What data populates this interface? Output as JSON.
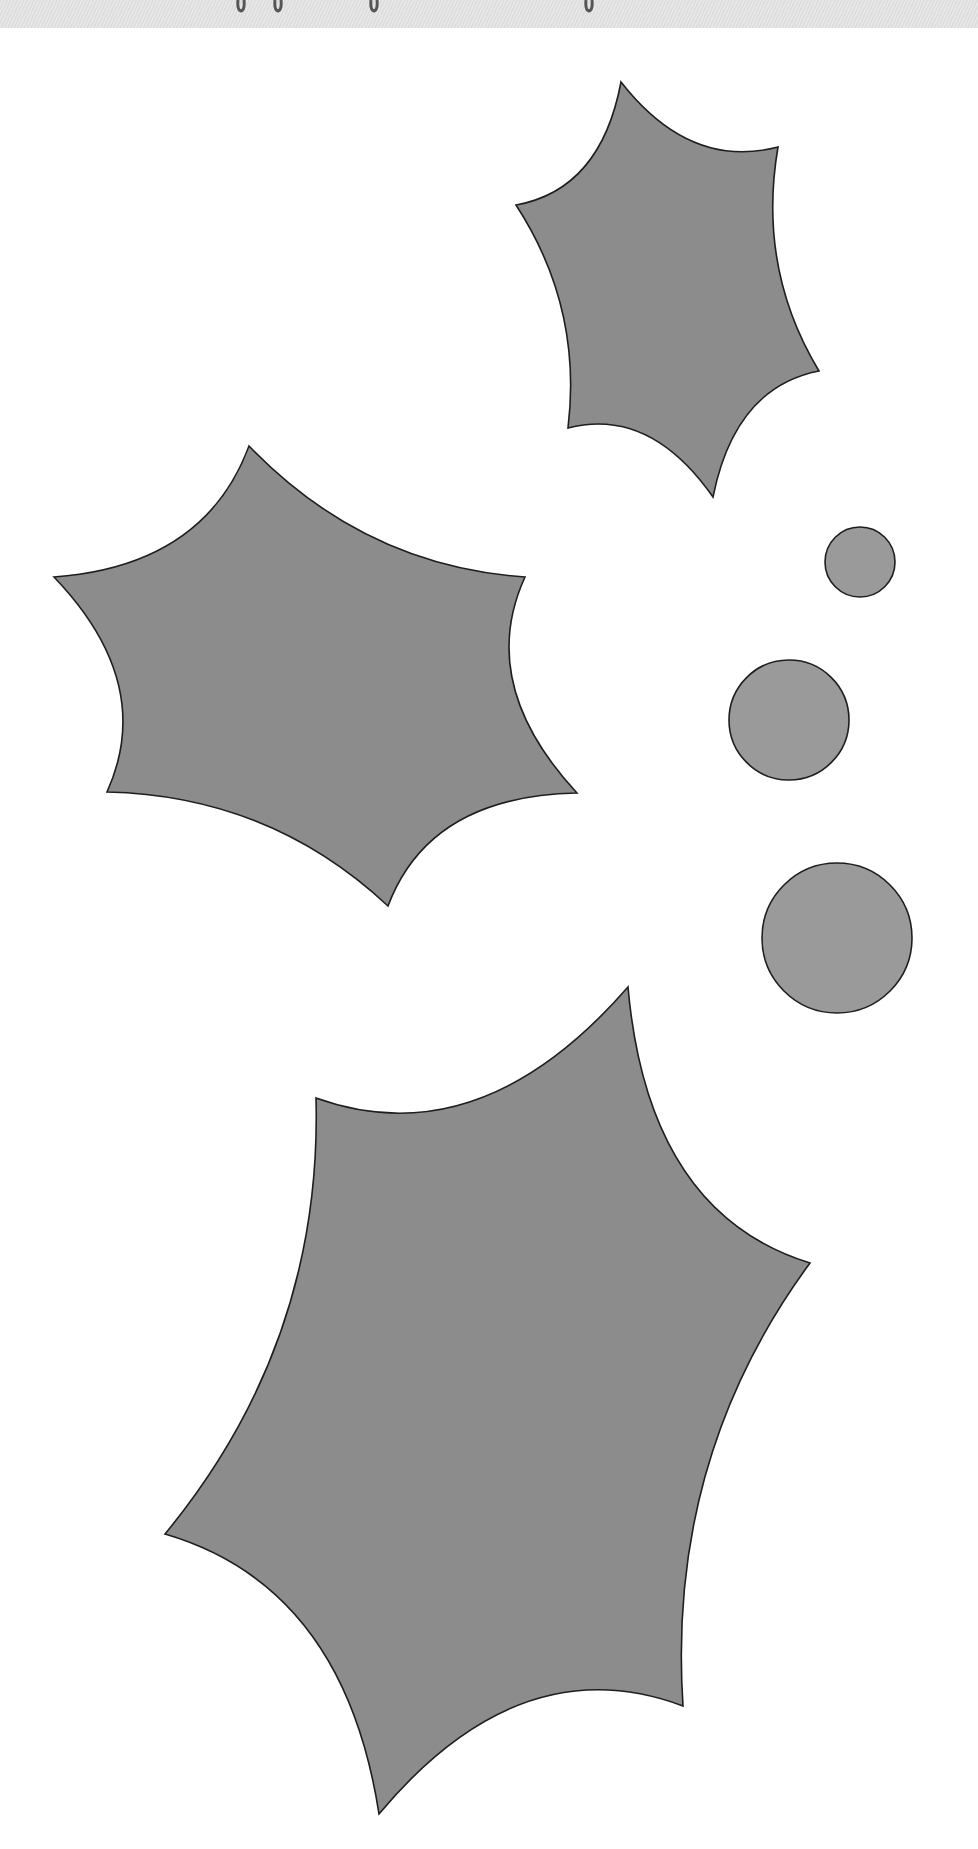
{
  "page": {
    "width": 978,
    "height": 1849,
    "background": "#ffffff"
  },
  "top_band": {
    "height": 28,
    "color": "#e2e2e2",
    "descender_loops_x": [
      241,
      278,
      374,
      589
    ],
    "glyph_color": "#555555"
  },
  "style": {
    "leaf_fill": "#8c8c8c",
    "berry_fill": "#9a9a9a",
    "outline": "#1e1e1e"
  },
  "leaves": [
    {
      "name": "top-right-leaf",
      "points": [
        [
          621,
          82
        ],
        [
          778,
          147
        ],
        [
          819,
          371
        ],
        [
          713,
          497
        ],
        [
          568,
          428
        ],
        [
          516,
          205
        ]
      ]
    },
    {
      "name": "left-leaf",
      "points": [
        [
          249,
          446
        ],
        [
          525,
          577
        ],
        [
          577,
          793
        ],
        [
          388,
          906
        ],
        [
          107,
          792
        ],
        [
          54,
          577
        ]
      ]
    },
    {
      "name": "bottom-leaf",
      "points": [
        [
          628,
          987
        ],
        [
          810,
          1263
        ],
        [
          683,
          1706
        ],
        [
          379,
          1814
        ],
        [
          165,
          1534
        ],
        [
          316,
          1098
        ]
      ]
    }
  ],
  "berries": [
    {
      "name": "small-berry",
      "cx": 860,
      "cy": 562,
      "r": 35
    },
    {
      "name": "medium-berry",
      "cx": 789,
      "cy": 720,
      "r": 60
    },
    {
      "name": "large-berry",
      "cx": 837,
      "cy": 938,
      "r": 75
    }
  ]
}
